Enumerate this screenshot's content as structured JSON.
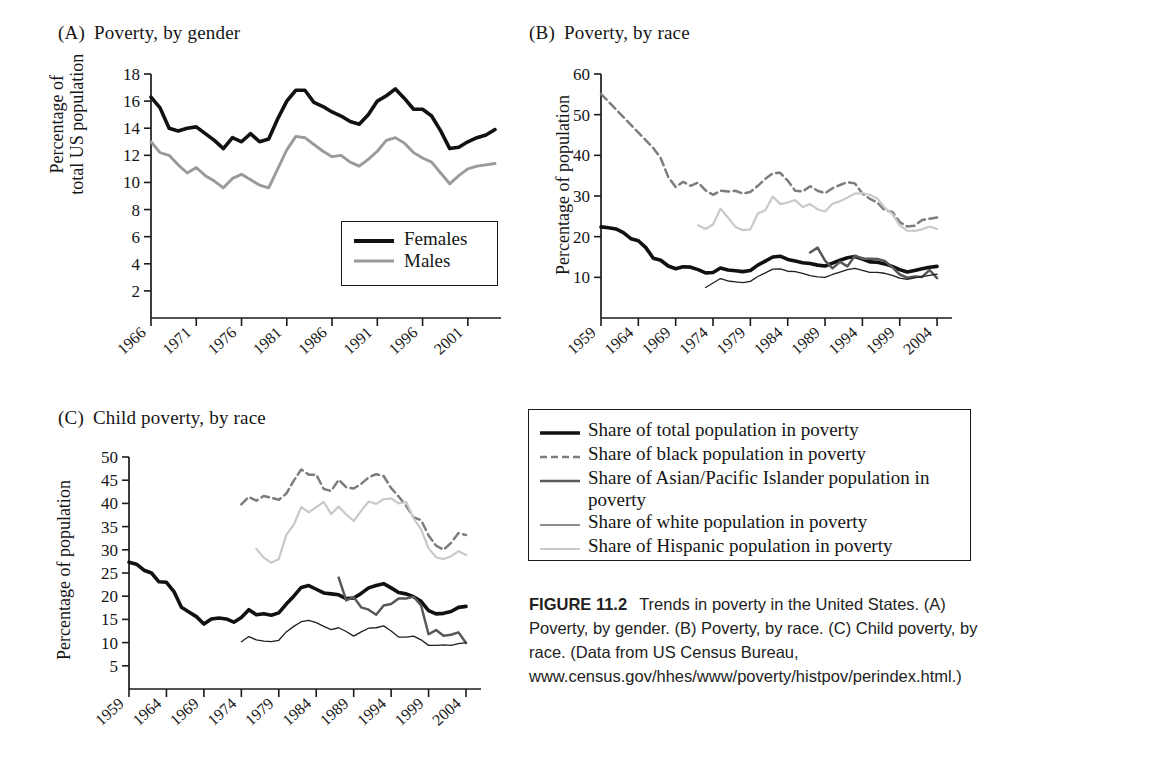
{
  "figure": {
    "caption_label": "FIGURE 11.2",
    "caption_text": "Trends in poverty in the United States. (A) Poverty, by gender. (B) Poverty, by race. (C) Child poverty, by race. (Data from US Census Bureau, www.census.gov/hhes/www/poverty/histpov/perindex.html.)"
  },
  "colors": {
    "black": "#111111",
    "dark_gray": "#585858",
    "mid_gray": "#8f8f8f",
    "light_gray": "#c9c9c9",
    "axis": "#1a1a1a"
  },
  "shared_legend": {
    "items": [
      {
        "label": "Share of total population in poverty",
        "style": "solid",
        "color": "#111111",
        "width": 3.6
      },
      {
        "label": "Share of black population in poverty",
        "style": "dashed",
        "color": "#7d7d7d",
        "width": 2.6
      },
      {
        "label": "Share of Asian/Pacific Islander population in poverty",
        "style": "solid",
        "color": "#585858",
        "width": 2.4
      },
      {
        "label": "Share of white population in poverty",
        "style": "solid",
        "color": "#1f1f1f",
        "width": 1.2
      },
      {
        "label": "Share of Hispanic population in poverty",
        "style": "solid",
        "color": "#c9c9c9",
        "width": 2.0
      }
    ]
  },
  "panelA": {
    "letter": "(A)",
    "title": "Poverty, by gender",
    "ylabel_line1": "Percentage of",
    "ylabel_line2": "total US population",
    "legend": [
      {
        "label": "Females",
        "color": "#111111",
        "width": 3.8
      },
      {
        "label": "Males",
        "color": "#9a9a9a",
        "width": 3.0
      }
    ]
  },
  "panelB": {
    "letter": "(B)",
    "title": "Poverty, by race",
    "ylabel": "Percentage of population"
  },
  "panelC": {
    "letter": "(C)",
    "title": "Child poverty, by race",
    "ylabel": "Percentage of population"
  },
  "chart_data": [
    {
      "id": "A",
      "type": "line",
      "title": "(A) Poverty, by gender",
      "xlabel": "",
      "ylabel": "Percentage of total US population",
      "xlim": [
        1966,
        2004
      ],
      "ylim": [
        0,
        18
      ],
      "yticks": [
        2,
        4,
        6,
        8,
        10,
        12,
        14,
        16,
        18
      ],
      "xticks": [
        1966,
        1971,
        1976,
        1981,
        1986,
        1991,
        1996,
        2001
      ],
      "grid": false,
      "legend_position": "inside-bottom-right",
      "x": [
        1966,
        1967,
        1968,
        1969,
        1970,
        1971,
        1972,
        1973,
        1974,
        1975,
        1976,
        1977,
        1978,
        1979,
        1980,
        1981,
        1982,
        1983,
        1984,
        1985,
        1986,
        1987,
        1988,
        1989,
        1990,
        1991,
        1992,
        1993,
        1994,
        1995,
        1996,
        1997,
        1998,
        1999,
        2000,
        2001,
        2002,
        2003,
        2004
      ],
      "series": [
        {
          "name": "Females",
          "color": "#111111",
          "style": "solid",
          "values": [
            16.3,
            15.5,
            14.0,
            13.8,
            14.0,
            14.1,
            13.6,
            13.1,
            12.5,
            13.3,
            13.0,
            13.6,
            13.0,
            13.2,
            14.7,
            16.0,
            16.8,
            16.8,
            15.9,
            15.6,
            15.2,
            14.9,
            14.5,
            14.3,
            15.0,
            16.0,
            16.4,
            16.9,
            16.2,
            15.4,
            15.4,
            14.9,
            13.8,
            12.5,
            12.6,
            13.0,
            13.3,
            13.5,
            13.9
          ]
        },
        {
          "name": "Males",
          "color": "#9a9a9a",
          "style": "solid",
          "values": [
            13.0,
            12.2,
            12.0,
            11.3,
            10.7,
            11.1,
            10.5,
            10.1,
            9.6,
            10.3,
            10.6,
            10.2,
            9.8,
            9.6,
            11.0,
            12.4,
            13.4,
            13.3,
            12.8,
            12.3,
            11.9,
            12.0,
            11.5,
            11.2,
            11.7,
            12.3,
            13.1,
            13.3,
            12.9,
            12.2,
            11.8,
            11.5,
            10.7,
            9.9,
            10.5,
            11.0,
            11.2,
            11.3,
            11.4
          ]
        }
      ]
    },
    {
      "id": "B",
      "type": "line",
      "title": "(B) Poverty, by race",
      "xlabel": "",
      "ylabel": "Percentage of population",
      "xlim": [
        1959,
        2006
      ],
      "ylim": [
        0,
        60
      ],
      "yticks": [
        10,
        20,
        30,
        40,
        50,
        60
      ],
      "xticks": [
        1959,
        1964,
        1969,
        1974,
        1979,
        1984,
        1989,
        1994,
        1999,
        2004
      ],
      "grid": false,
      "legend_position": "shared-external",
      "series": [
        {
          "name": "Share of total population in poverty",
          "color": "#111111",
          "style": "solid",
          "x": [
            1959,
            1960,
            1961,
            1962,
            1963,
            1964,
            1965,
            1966,
            1967,
            1968,
            1969,
            1970,
            1971,
            1972,
            1973,
            1974,
            1975,
            1976,
            1977,
            1978,
            1979,
            1980,
            1981,
            1982,
            1983,
            1984,
            1985,
            1986,
            1987,
            1988,
            1989,
            1990,
            1991,
            1992,
            1993,
            1994,
            1995,
            1996,
            1997,
            1998,
            1999,
            2000,
            2001,
            2002,
            2003,
            2004
          ],
          "values": [
            22.4,
            22.2,
            21.9,
            21.0,
            19.5,
            19.0,
            17.3,
            14.7,
            14.2,
            12.8,
            12.1,
            12.6,
            12.5,
            11.9,
            11.1,
            11.2,
            12.3,
            11.8,
            11.6,
            11.4,
            11.7,
            13.0,
            14.0,
            15.0,
            15.2,
            14.4,
            14.0,
            13.6,
            13.4,
            13.0,
            12.8,
            13.5,
            14.2,
            14.8,
            15.1,
            14.5,
            13.8,
            13.7,
            13.3,
            12.7,
            11.9,
            11.3,
            11.7,
            12.1,
            12.5,
            12.7
          ]
        },
        {
          "name": "Share of black population in poverty",
          "color": "#7d7d7d",
          "style": "dashed",
          "x": [
            1959,
            1966,
            1967,
            1968,
            1969,
            1970,
            1971,
            1972,
            1973,
            1974,
            1975,
            1976,
            1977,
            1978,
            1979,
            1980,
            1981,
            1982,
            1983,
            1984,
            1985,
            1986,
            1987,
            1988,
            1989,
            1990,
            1991,
            1992,
            1993,
            1994,
            1995,
            1996,
            1997,
            1998,
            1999,
            2000,
            2001,
            2002,
            2003,
            2004
          ],
          "values": [
            55.1,
            41.8,
            39.3,
            34.7,
            32.2,
            33.5,
            32.5,
            33.3,
            31.4,
            30.3,
            31.3,
            31.1,
            31.3,
            30.6,
            31.0,
            32.5,
            34.2,
            35.6,
            35.7,
            33.8,
            31.3,
            31.1,
            32.4,
            31.3,
            30.7,
            31.9,
            32.7,
            33.4,
            33.1,
            30.6,
            29.3,
            28.4,
            26.5,
            26.1,
            23.6,
            22.5,
            22.7,
            24.1,
            24.4,
            24.7
          ]
        },
        {
          "name": "Share of Asian/Pacific Islander population in poverty",
          "color": "#585858",
          "style": "solid",
          "x": [
            1987,
            1988,
            1989,
            1990,
            1991,
            1992,
            1993,
            1994,
            1995,
            1996,
            1997,
            1998,
            1999,
            2000,
            2001,
            2002,
            2003,
            2004
          ],
          "values": [
            16.1,
            17.3,
            14.1,
            12.2,
            13.8,
            12.7,
            15.3,
            14.6,
            14.6,
            14.5,
            14.0,
            12.5,
            10.7,
            9.9,
            10.2,
            10.1,
            11.8,
            9.8
          ]
        },
        {
          "name": "Share of white population in poverty",
          "color": "#1f1f1f",
          "style": "solid",
          "x": [
            1973,
            1974,
            1975,
            1976,
            1977,
            1978,
            1979,
            1980,
            1981,
            1982,
            1983,
            1984,
            1985,
            1986,
            1987,
            1988,
            1989,
            1990,
            1991,
            1992,
            1993,
            1994,
            1995,
            1996,
            1997,
            1998,
            1999,
            2000,
            2001,
            2002,
            2003,
            2004
          ],
          "values": [
            7.5,
            8.6,
            9.7,
            9.1,
            8.9,
            8.7,
            9.0,
            10.2,
            11.1,
            12.0,
            12.1,
            11.5,
            11.4,
            11.0,
            10.4,
            10.1,
            10.0,
            10.7,
            11.3,
            11.9,
            12.2,
            11.7,
            11.2,
            11.2,
            11.0,
            10.5,
            9.8,
            9.5,
            9.9,
            10.2,
            10.5,
            10.8
          ]
        },
        {
          "name": "Share of Hispanic population in poverty",
          "color": "#c9c9c9",
          "style": "solid",
          "x": [
            1972,
            1973,
            1974,
            1975,
            1976,
            1977,
            1978,
            1979,
            1980,
            1981,
            1982,
            1983,
            1984,
            1985,
            1986,
            1987,
            1988,
            1989,
            1990,
            1991,
            1992,
            1993,
            1994,
            1995,
            1996,
            1997,
            1998,
            1999,
            2000,
            2001,
            2002,
            2003,
            2004
          ],
          "values": [
            22.8,
            21.9,
            23.0,
            26.9,
            24.7,
            22.4,
            21.6,
            21.8,
            25.7,
            26.5,
            29.9,
            28.0,
            28.4,
            29.0,
            27.3,
            28.0,
            26.7,
            26.2,
            28.1,
            28.7,
            29.6,
            30.6,
            30.7,
            30.3,
            29.4,
            27.1,
            25.6,
            22.8,
            21.5,
            21.4,
            21.8,
            22.5,
            21.9
          ]
        }
      ]
    },
    {
      "id": "C",
      "type": "line",
      "title": "(C) Child poverty, by race",
      "xlabel": "",
      "ylabel": "Percentage of population",
      "xlim": [
        1959,
        2006
      ],
      "ylim": [
        0,
        50
      ],
      "yticks": [
        5,
        10,
        15,
        20,
        25,
        30,
        35,
        40,
        45,
        50
      ],
      "xticks": [
        1959,
        1964,
        1969,
        1974,
        1979,
        1984,
        1989,
        1994,
        1999,
        2004
      ],
      "grid": false,
      "legend_position": "shared-external",
      "series": [
        {
          "name": "Share of total population in poverty",
          "color": "#111111",
          "style": "solid",
          "x": [
            1959,
            1960,
            1961,
            1962,
            1963,
            1964,
            1965,
            1966,
            1967,
            1968,
            1969,
            1970,
            1971,
            1972,
            1973,
            1974,
            1975,
            1976,
            1977,
            1978,
            1979,
            1980,
            1981,
            1982,
            1983,
            1984,
            1985,
            1986,
            1987,
            1988,
            1989,
            1990,
            1991,
            1992,
            1993,
            1994,
            1995,
            1996,
            1997,
            1998,
            1999,
            2000,
            2001,
            2002,
            2003,
            2004
          ],
          "values": [
            27.3,
            26.9,
            25.6,
            25.0,
            23.1,
            23.0,
            21.0,
            17.6,
            16.6,
            15.6,
            14.0,
            15.1,
            15.3,
            15.1,
            14.4,
            15.4,
            17.1,
            16.0,
            16.2,
            15.9,
            16.4,
            18.3,
            20.0,
            21.9,
            22.3,
            21.5,
            20.7,
            20.5,
            20.3,
            19.5,
            19.6,
            20.6,
            21.8,
            22.3,
            22.7,
            21.8,
            20.8,
            20.5,
            19.9,
            18.9,
            16.9,
            16.2,
            16.3,
            16.7,
            17.6,
            17.8
          ]
        },
        {
          "name": "Share of black population in poverty",
          "color": "#7d7d7d",
          "style": "dashed",
          "x": [
            1974,
            1975,
            1976,
            1977,
            1978,
            1979,
            1980,
            1981,
            1982,
            1983,
            1984,
            1985,
            1986,
            1987,
            1988,
            1989,
            1990,
            1991,
            1992,
            1993,
            1994,
            1995,
            1996,
            1997,
            1998,
            1999,
            2000,
            2001,
            2002,
            2003,
            2004
          ],
          "values": [
            39.8,
            41.4,
            40.6,
            41.6,
            41.2,
            40.8,
            42.1,
            44.9,
            47.3,
            46.2,
            46.2,
            43.1,
            42.7,
            45.1,
            43.5,
            43.2,
            44.2,
            45.6,
            46.3,
            45.9,
            43.3,
            41.5,
            39.5,
            37.0,
            36.4,
            33.1,
            30.9,
            30.0,
            31.5,
            33.6,
            33.2
          ]
        },
        {
          "name": "Share of Asian/Pacific Islander population in poverty",
          "color": "#585858",
          "style": "solid",
          "x": [
            1987,
            1988,
            1989,
            1990,
            1991,
            1992,
            1993,
            1994,
            1995,
            1996,
            1997,
            1998,
            1999,
            2000,
            2001,
            2002,
            2003,
            2004
          ],
          "values": [
            24.0,
            19.1,
            19.8,
            17.6,
            17.1,
            16.0,
            18.0,
            18.3,
            19.5,
            19.5,
            19.9,
            18.0,
            11.8,
            12.7,
            11.5,
            11.7,
            12.2,
            9.9
          ]
        },
        {
          "name": "Share of white population in poverty",
          "color": "#1f1f1f",
          "style": "solid",
          "x": [
            1974,
            1975,
            1976,
            1977,
            1978,
            1979,
            1980,
            1981,
            1982,
            1983,
            1984,
            1985,
            1986,
            1987,
            1988,
            1989,
            1990,
            1991,
            1992,
            1993,
            1994,
            1995,
            1996,
            1997,
            1998,
            1999,
            2000,
            2001,
            2002,
            2003,
            2004
          ],
          "values": [
            10.2,
            11.3,
            10.6,
            10.3,
            10.2,
            10.5,
            12.3,
            13.5,
            14.5,
            14.8,
            14.3,
            13.5,
            12.8,
            13.2,
            12.4,
            11.4,
            12.3,
            13.1,
            13.2,
            13.6,
            12.5,
            11.2,
            11.2,
            11.4,
            10.6,
            9.4,
            9.4,
            9.5,
            9.4,
            9.8,
            10.0
          ]
        },
        {
          "name": "Share of Hispanic population in poverty",
          "color": "#c9c9c9",
          "style": "solid",
          "x": [
            1976,
            1977,
            1978,
            1979,
            1980,
            1981,
            1982,
            1983,
            1984,
            1985,
            1986,
            1987,
            1988,
            1989,
            1990,
            1991,
            1992,
            1993,
            1994,
            1995,
            1996,
            1997,
            1998,
            1999,
            2000,
            2001,
            2002,
            2003,
            2004
          ],
          "values": [
            30.2,
            28.3,
            27.2,
            28.0,
            33.2,
            35.4,
            39.2,
            38.1,
            39.2,
            40.3,
            37.7,
            39.3,
            37.6,
            36.2,
            38.4,
            40.4,
            39.9,
            40.9,
            41.1,
            40.0,
            40.3,
            36.8,
            34.4,
            30.3,
            28.4,
            28.0,
            28.6,
            29.7,
            28.9
          ]
        }
      ]
    }
  ]
}
